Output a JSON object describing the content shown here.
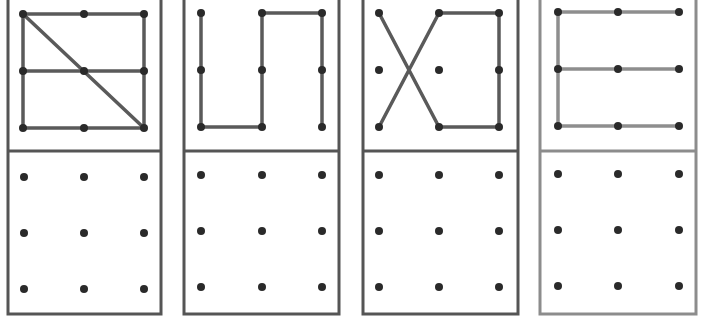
{
  "figure": {
    "grid_size": 3,
    "colors": {
      "frame_dark": "#555555",
      "frame_light": "#8c8c8c",
      "line_dark": "#5a5a5a",
      "line_light": "#8e8e8e",
      "dot": "#2a2a2a",
      "background": "#ffffff"
    },
    "panels": [
      {
        "id": "panel-1",
        "name": "square-with-midline-and-diagonal",
        "style": "dark",
        "frame": {
          "x": 8,
          "w": 153
        },
        "top_dots": {
          "xs": [
            23,
            84,
            144
          ],
          "ys": [
            14,
            71,
            128
          ]
        },
        "bottom_dots": {
          "xs": [
            24,
            84,
            144
          ],
          "ys": [
            177,
            233,
            289
          ]
        },
        "segments": [
          [
            0,
            0,
            2,
            0
          ],
          [
            0,
            0,
            0,
            2
          ],
          [
            2,
            0,
            2,
            2
          ],
          [
            0,
            2,
            2,
            2
          ],
          [
            0,
            1,
            2,
            1
          ],
          [
            0,
            0,
            2,
            2
          ]
        ]
      },
      {
        "id": "panel-2",
        "name": "zigzag-u-n-shape",
        "style": "dark",
        "frame": {
          "x": 184,
          "w": 155
        },
        "top_dots": {
          "xs": [
            201,
            262,
            322
          ],
          "ys": [
            13,
            70,
            127
          ]
        },
        "bottom_dots": {
          "xs": [
            201,
            262,
            322
          ],
          "ys": [
            175,
            231,
            287
          ]
        },
        "segments": [
          [
            0,
            0,
            0,
            2
          ],
          [
            0,
            2,
            1,
            2
          ],
          [
            1,
            2,
            1,
            0
          ],
          [
            1,
            0,
            2,
            0
          ],
          [
            2,
            0,
            2,
            2
          ]
        ]
      },
      {
        "id": "panel-3",
        "name": "x-cross-with-bracket",
        "style": "dark",
        "frame": {
          "x": 363,
          "w": 155
        },
        "top_dots": {
          "xs": [
            379,
            439,
            499
          ],
          "ys": [
            13,
            70,
            127
          ]
        },
        "bottom_dots": {
          "xs": [
            379,
            439,
            499
          ],
          "ys": [
            175,
            231,
            287
          ]
        },
        "segments": [
          [
            0,
            0,
            1,
            2
          ],
          [
            0,
            2,
            1,
            0
          ],
          [
            1,
            0,
            2,
            0
          ],
          [
            2,
            0,
            2,
            2
          ],
          [
            1,
            2,
            2,
            2
          ]
        ]
      },
      {
        "id": "panel-4",
        "name": "letter-e-shape",
        "style": "light",
        "frame": {
          "x": 540,
          "w": 156
        },
        "top_dots": {
          "xs": [
            558,
            618,
            679
          ],
          "ys": [
            12,
            69,
            126
          ]
        },
        "bottom_dots": {
          "xs": [
            558,
            618,
            679
          ],
          "ys": [
            174,
            230,
            286
          ]
        },
        "segments": [
          [
            0,
            0,
            2,
            0
          ],
          [
            0,
            1,
            2,
            1
          ],
          [
            0,
            2,
            2,
            2
          ],
          [
            0,
            0,
            0,
            2
          ]
        ]
      }
    ],
    "frame_top": -4,
    "frame_divider_y": 151,
    "frame_bottom": 314
  }
}
